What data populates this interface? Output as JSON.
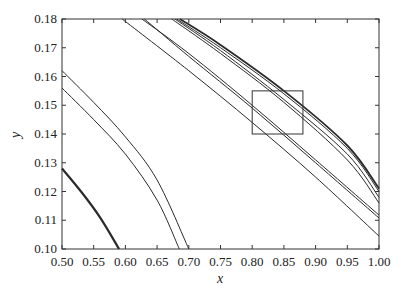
{
  "chart_data": {
    "type": "line",
    "title": "",
    "xlabel": "x",
    "ylabel": "y",
    "xlim": [
      0.5,
      1.0
    ],
    "ylim": [
      0.1,
      0.18
    ],
    "grid": false,
    "legend": null,
    "xticks": [
      "0.50",
      "0.55",
      "0.60",
      "0.65",
      "0.70",
      "0.75",
      "0.80",
      "0.85",
      "0.90",
      "0.95",
      "1.00"
    ],
    "yticks": [
      "0.10",
      "0.11",
      "0.12",
      "0.13",
      "0.14",
      "0.15",
      "0.16",
      "0.17",
      "0.18"
    ],
    "series": [
      {
        "name": "curve-1",
        "width": 2.2,
        "points": [
          [
            0.5,
            0.128
          ],
          [
            0.53,
            0.12
          ],
          [
            0.56,
            0.111
          ],
          [
            0.59,
            0.1
          ]
        ]
      },
      {
        "name": "curve-2",
        "width": 1,
        "points": [
          [
            0.5,
            0.156
          ],
          [
            0.55,
            0.145
          ],
          [
            0.6,
            0.133
          ],
          [
            0.65,
            0.117
          ],
          [
            0.685,
            0.1
          ]
        ]
      },
      {
        "name": "curve-3",
        "width": 1,
        "points": [
          [
            0.5,
            0.162
          ],
          [
            0.55,
            0.151
          ],
          [
            0.6,
            0.139
          ],
          [
            0.65,
            0.124
          ],
          [
            0.7,
            0.1
          ]
        ]
      },
      {
        "name": "curve-4",
        "width": 1,
        "points": [
          [
            0.595,
            0.18
          ],
          [
            0.7,
            0.162
          ],
          [
            0.8,
            0.144
          ],
          [
            0.9,
            0.125
          ],
          [
            1.0,
            0.1045
          ]
        ]
      },
      {
        "name": "curve-5",
        "width": 1,
        "points": [
          [
            0.626,
            0.18
          ],
          [
            0.7,
            0.168
          ],
          [
            0.8,
            0.15
          ],
          [
            0.9,
            0.131
          ],
          [
            1.0,
            0.1118
          ]
        ]
      },
      {
        "name": "curve-6",
        "width": 1,
        "points": [
          [
            0.63,
            0.18
          ],
          [
            0.7,
            0.167
          ],
          [
            0.8,
            0.149
          ],
          [
            0.9,
            0.13
          ],
          [
            1.0,
            0.1108
          ]
        ]
      },
      {
        "name": "curve-7",
        "width": 1,
        "points": [
          [
            0.673,
            0.18
          ],
          [
            0.75,
            0.168
          ],
          [
            0.85,
            0.151
          ],
          [
            0.95,
            0.131
          ],
          [
            1.0,
            0.116
          ]
        ]
      },
      {
        "name": "curve-8",
        "width": 1,
        "points": [
          [
            0.678,
            0.18
          ],
          [
            0.75,
            0.169
          ],
          [
            0.85,
            0.152
          ],
          [
            0.95,
            0.133
          ],
          [
            1.0,
            0.118
          ]
        ]
      },
      {
        "name": "curve-9",
        "width": 1,
        "points": [
          [
            0.681,
            0.18
          ],
          [
            0.75,
            0.17
          ],
          [
            0.85,
            0.154
          ],
          [
            0.95,
            0.135
          ],
          [
            1.0,
            0.12
          ]
        ]
      },
      {
        "name": "curve-10",
        "width": 1.8,
        "points": [
          [
            0.686,
            0.18
          ],
          [
            0.75,
            0.171
          ],
          [
            0.85,
            0.155
          ],
          [
            0.95,
            0.136
          ],
          [
            1.0,
            0.121
          ]
        ]
      }
    ],
    "annotations": [
      {
        "type": "rectangle",
        "x0": 0.8,
        "x1": 0.88,
        "y0": 0.14,
        "y1": 0.155
      }
    ]
  }
}
